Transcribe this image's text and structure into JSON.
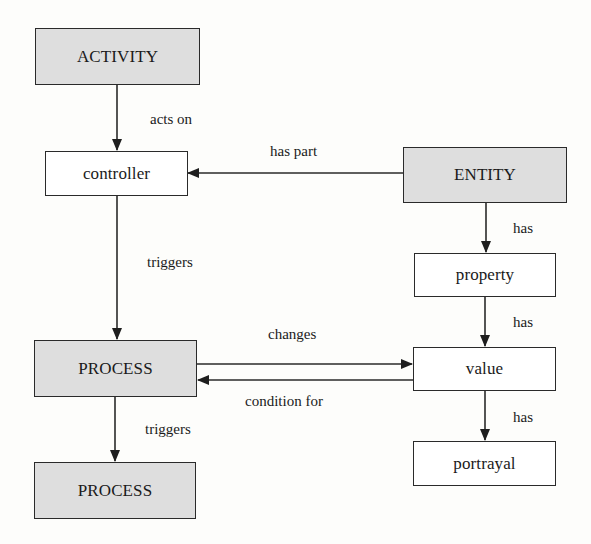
{
  "diagram": {
    "type": "conceptual-model",
    "nodes": [
      {
        "id": "activity",
        "label": "ACTIVITY",
        "kind": "class",
        "fill": "#dedede"
      },
      {
        "id": "controller",
        "label": "controller",
        "kind": "instance",
        "fill": "#ffffff"
      },
      {
        "id": "entity",
        "label": "ENTITY",
        "kind": "class",
        "fill": "#dedede"
      },
      {
        "id": "property",
        "label": "property",
        "kind": "instance",
        "fill": "#ffffff"
      },
      {
        "id": "value",
        "label": "value",
        "kind": "instance",
        "fill": "#ffffff"
      },
      {
        "id": "portrayal",
        "label": "portrayal",
        "kind": "instance",
        "fill": "#ffffff"
      },
      {
        "id": "process1",
        "label": "PROCESS",
        "kind": "class",
        "fill": "#dedede"
      },
      {
        "id": "process2",
        "label": "PROCESS",
        "kind": "class",
        "fill": "#dedede"
      }
    ],
    "edges": [
      {
        "from": "activity",
        "to": "controller",
        "label": "acts on"
      },
      {
        "from": "entity",
        "to": "controller",
        "label": "has part"
      },
      {
        "from": "controller",
        "to": "process1",
        "label": "triggers"
      },
      {
        "from": "entity",
        "to": "property",
        "label": "has"
      },
      {
        "from": "property",
        "to": "value",
        "label": "has"
      },
      {
        "from": "value",
        "to": "portrayal",
        "label": "has"
      },
      {
        "from": "process1",
        "to": "value",
        "label": "changes"
      },
      {
        "from": "value",
        "to": "process1",
        "label": "condition for"
      },
      {
        "from": "process1",
        "to": "process2",
        "label": "triggers"
      }
    ]
  },
  "colors": {
    "class_fill": "#dedede",
    "instance_fill": "#ffffff",
    "stroke": "#2a2a2a"
  }
}
